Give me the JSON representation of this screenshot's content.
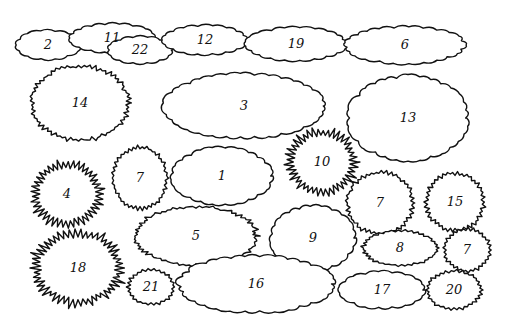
{
  "diagram": {
    "title": "",
    "background": "#ffffff",
    "stroke": "#111111",
    "plants": [
      {
        "id": "2",
        "label": "2",
        "cx": 48,
        "cy": 45,
        "rx": 32,
        "ry": 14,
        "style": "scallop"
      },
      {
        "id": "11",
        "label": "11",
        "cx": 112,
        "cy": 38,
        "rx": 42,
        "ry": 14,
        "style": "scallop"
      },
      {
        "id": "22",
        "label": "22",
        "cx": 140,
        "cy": 50,
        "rx": 32,
        "ry": 13,
        "style": "scallop"
      },
      {
        "id": "12",
        "label": "12",
        "cx": 205,
        "cy": 40,
        "rx": 42,
        "ry": 14,
        "style": "scallop"
      },
      {
        "id": "19",
        "label": "19",
        "cx": 296,
        "cy": 44,
        "rx": 50,
        "ry": 16,
        "style": "scallop"
      },
      {
        "id": "6",
        "label": "6",
        "cx": 405,
        "cy": 45,
        "rx": 60,
        "ry": 18,
        "style": "scallop"
      },
      {
        "id": "14",
        "label": "14",
        "cx": 80,
        "cy": 103,
        "rx": 50,
        "ry": 38,
        "style": "serrate"
      },
      {
        "id": "3",
        "label": "3",
        "cx": 244,
        "cy": 106,
        "rx": 80,
        "ry": 32,
        "style": "scallop"
      },
      {
        "id": "13",
        "label": "13",
        "cx": 408,
        "cy": 118,
        "rx": 60,
        "ry": 42,
        "style": "scallop"
      },
      {
        "id": "4",
        "label": "4",
        "cx": 67,
        "cy": 194,
        "rx": 34,
        "ry": 32,
        "style": "spiky"
      },
      {
        "id": "7a",
        "label": "7",
        "cx": 140,
        "cy": 178,
        "rx": 28,
        "ry": 32,
        "style": "serrate"
      },
      {
        "id": "1",
        "label": "1",
        "cx": 222,
        "cy": 176,
        "rx": 50,
        "ry": 28,
        "style": "scallop"
      },
      {
        "id": "10",
        "label": "10",
        "cx": 322,
        "cy": 162,
        "rx": 34,
        "ry": 32,
        "style": "spiky"
      },
      {
        "id": "7b",
        "label": "7",
        "cx": 380,
        "cy": 203,
        "rx": 34,
        "ry": 32,
        "style": "serrate"
      },
      {
        "id": "15",
        "label": "15",
        "cx": 455,
        "cy": 202,
        "rx": 30,
        "ry": 30,
        "style": "serrate"
      },
      {
        "id": "5",
        "label": "5",
        "cx": 196,
        "cy": 236,
        "rx": 62,
        "ry": 30,
        "style": "serrate"
      },
      {
        "id": "9",
        "label": "9",
        "cx": 313,
        "cy": 238,
        "rx": 42,
        "ry": 32,
        "style": "scallop"
      },
      {
        "id": "8",
        "label": "8",
        "cx": 400,
        "cy": 248,
        "rx": 38,
        "ry": 18,
        "style": "serrate"
      },
      {
        "id": "7c",
        "label": "7",
        "cx": 467,
        "cy": 250,
        "rx": 24,
        "ry": 22,
        "style": "serrate"
      },
      {
        "id": "18",
        "label": "18",
        "cx": 78,
        "cy": 268,
        "rx": 44,
        "ry": 36,
        "style": "spiky"
      },
      {
        "id": "21",
        "label": "21",
        "cx": 151,
        "cy": 287,
        "rx": 24,
        "ry": 18,
        "style": "serrate"
      },
      {
        "id": "16",
        "label": "16",
        "cx": 256,
        "cy": 284,
        "rx": 78,
        "ry": 28,
        "style": "scallop"
      },
      {
        "id": "17",
        "label": "17",
        "cx": 382,
        "cy": 290,
        "rx": 42,
        "ry": 18,
        "style": "scallop"
      },
      {
        "id": "20",
        "label": "20",
        "cx": 454,
        "cy": 290,
        "rx": 28,
        "ry": 20,
        "style": "serrate"
      }
    ]
  }
}
